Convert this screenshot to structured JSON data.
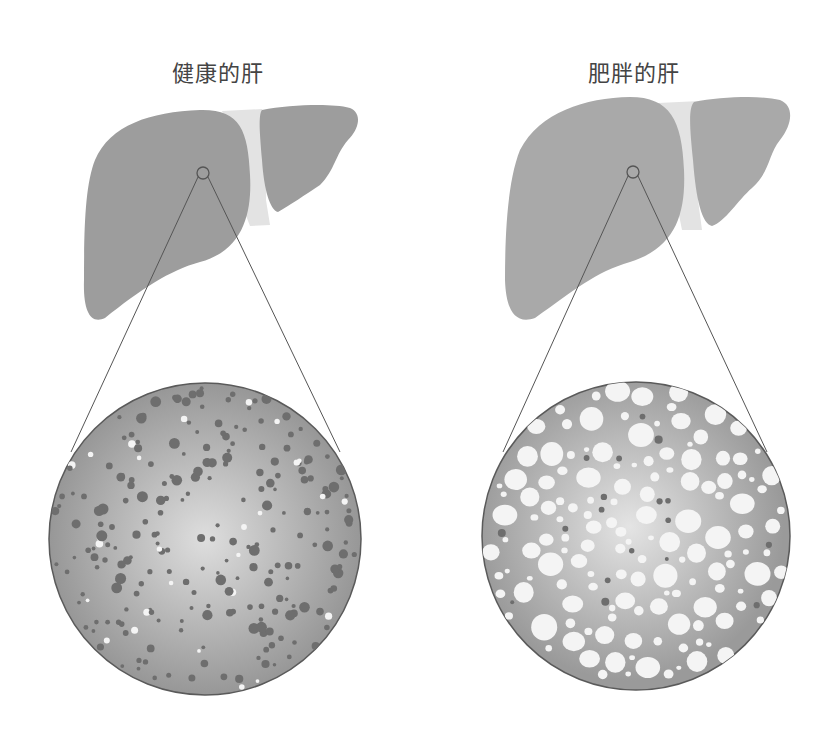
{
  "panels": [
    {
      "id": "healthy",
      "title": "健康的肝",
      "liver_color": "#9c9c9c",
      "ligament_color": "#e2e2e2",
      "magnifier_center": [
        203,
        173
      ],
      "detail_circle": {
        "cx": 205,
        "cy": 539,
        "r": 157
      },
      "cells": "small dark dots with few white droplets"
    },
    {
      "id": "fatty",
      "title": "肥胖的肝",
      "liver_color": "#a8a8a8",
      "ligament_color": "#e2e2e2",
      "magnifier_center": [
        633,
        172
      ],
      "detail_circle": {
        "cx": 636,
        "cy": 536,
        "r": 155
      },
      "cells": "many large white fat droplets with few dark dots"
    }
  ],
  "colors": {
    "text": "#444444",
    "outline": "#555555",
    "dot_dark": "#6e6e6e",
    "dot_light": "#f4f4f4",
    "circle_fill_center": "#dcdcdc",
    "circle_fill_edge": "#9a9a9a"
  }
}
